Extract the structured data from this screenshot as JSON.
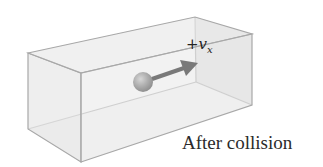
{
  "figure": {
    "caption": "After collision",
    "velocity_label": {
      "sign": "+",
      "symbol": "v",
      "subscript": "x"
    },
    "colors": {
      "box_fill": "#ececec",
      "box_edge": "#a8a8a8",
      "ball": "#8a8a8a",
      "arrow": "#3a3a3a"
    }
  }
}
